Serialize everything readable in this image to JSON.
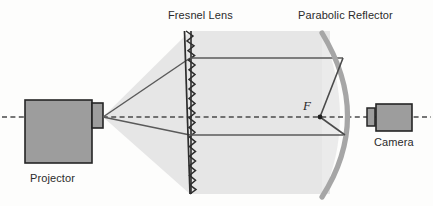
{
  "figure": {
    "type": "optical-ray-diagram",
    "background_color": "#fdfdfc",
    "ink_color": "#3a3a3a",
    "beam_fill_color": "#e2e2e2",
    "component_fill_color": "#9a9a9a",
    "reflector_color": "#a2a2a2"
  },
  "labels": {
    "fresnel_lens": "Fresnel Lens",
    "parabolic_reflector": "Parabolic Reflector",
    "projector": "Projector",
    "camera": "Camera",
    "focal_point": "F"
  },
  "components": {
    "projector": {
      "name": "Projector",
      "body": {
        "x": 25,
        "y": 100,
        "width": 67,
        "height": 63
      },
      "lens_barrel": {
        "x": 92,
        "y": 103,
        "width": 11,
        "height": 25
      }
    },
    "fresnel_lens": {
      "name": "Fresnel Lens",
      "plane_x": 190,
      "top_y": 31,
      "bottom_y": 194,
      "teeth": 24,
      "tooth_depth": 6
    },
    "parabolic_reflector": {
      "name": "Parabolic Reflector",
      "vertex": {
        "x": 348,
        "y": 117
      },
      "top_end": {
        "x": 322,
        "y": 33
      },
      "bottom_end": {
        "x": 322,
        "y": 197
      },
      "stroke_width": 5
    },
    "camera": {
      "name": "Camera",
      "body": {
        "x": 376,
        "y": 104,
        "width": 36,
        "height": 27
      },
      "lens_barrel": {
        "x": 367,
        "y": 109,
        "width": 8,
        "height": 17
      }
    },
    "focal_point": {
      "label": "F",
      "x": 320,
      "y": 117
    }
  },
  "optical_axis": {
    "y": 117,
    "x_start": 2,
    "x_end": 431,
    "style": "dashed"
  },
  "rays": {
    "diverging_cone": {
      "origin": {
        "x": 103,
        "y": 117
      },
      "upper_end": {
        "x": 190,
        "y": 58
      },
      "lower_end": {
        "x": 190,
        "y": 135
      }
    },
    "collimated": [
      {
        "x1": 190,
        "y1": 58,
        "x2": 343,
        "y2": 58
      },
      {
        "x1": 190,
        "y1": 135,
        "x2": 345,
        "y2": 135
      }
    ],
    "converging_to_focus": [
      {
        "x1": 343,
        "y1": 58,
        "x2": 320,
        "y2": 117
      },
      {
        "x1": 345,
        "y1": 135,
        "x2": 320,
        "y2": 117
      }
    ],
    "focus_to_camera": {
      "x1": 320,
      "y1": 117,
      "x2": 367,
      "y2": 117
    }
  },
  "beam_shading": {
    "cone_from_projector": [
      [
        103,
        117
      ],
      [
        190,
        31
      ],
      [
        190,
        194
      ]
    ],
    "collimated_block": {
      "x": 190,
      "y": 31,
      "width": 140,
      "height": 163
    }
  }
}
